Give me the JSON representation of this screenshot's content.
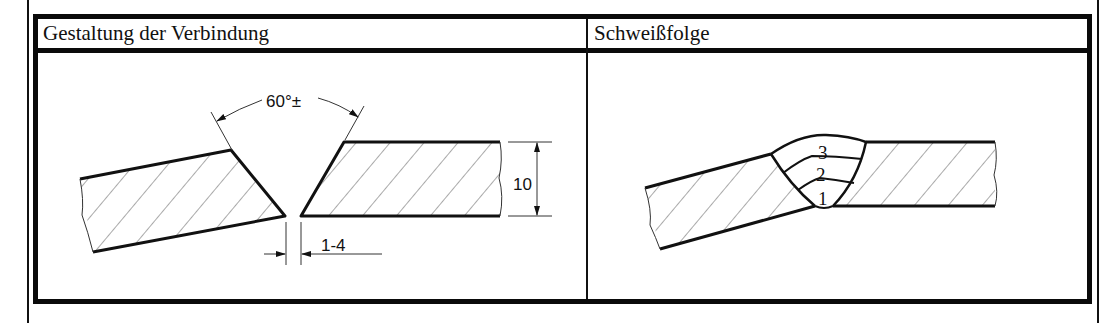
{
  "table": {
    "headers": [
      {
        "label": "Gestaltung der Verbindung"
      },
      {
        "label": "Schweißfolge"
      }
    ]
  },
  "joint_design": {
    "angle_label": "60°±",
    "thickness_label": "10",
    "gap_label": "1-4",
    "hatch": true
  },
  "weld_sequence": {
    "passes": [
      "1",
      "2",
      "3"
    ]
  },
  "colors": {
    "line": "#111111",
    "background": "#ffffff"
  }
}
